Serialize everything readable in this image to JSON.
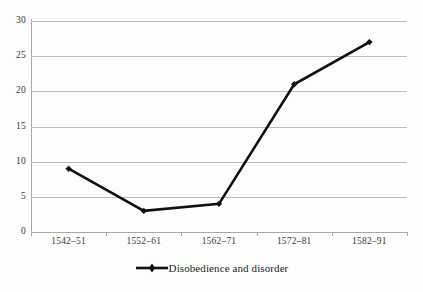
{
  "chart_data": {
    "type": "line",
    "title": "",
    "subtitle": "",
    "xlabel": "",
    "ylabel": "",
    "categories": [
      "1542–51",
      "1552–61",
      "1562–71",
      "1572–81",
      "1582–91"
    ],
    "series": [
      {
        "name": "Disobedience and disorder",
        "values": [
          9,
          3,
          4,
          21,
          27
        ],
        "color": "#111111",
        "marker": "diamond"
      }
    ],
    "ylim": [
      0,
      30
    ],
    "yticks": [
      0,
      5,
      10,
      15,
      20,
      25,
      30
    ],
    "ytick_labels": [
      "0",
      "5",
      "10",
      "15",
      "20",
      "25",
      "30"
    ],
    "grid": "horizontal",
    "legend_position": "bottom-center"
  },
  "legend": {
    "entries": [
      {
        "label": "Disobedience and disorder"
      }
    ]
  },
  "colors": {
    "series": "#111111",
    "gridline": "#bcbcbc",
    "axis": "#a8a8a8",
    "text": "#3a3a3a",
    "background": "#fdfdfd"
  }
}
